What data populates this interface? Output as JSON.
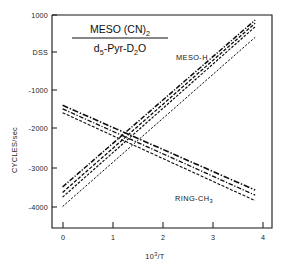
{
  "figure": {
    "background_color": "#ffffff",
    "line_color": "#0d0d0d",
    "axis_color": "#151515"
  },
  "title": {
    "numerator_main": "MESO (CN)",
    "numerator_sub": "2",
    "denominator_p1": "d",
    "denominator_p1_sub": "5",
    "denominator_p2": "-Pyr-D",
    "denominator_p2_sub": "2",
    "denominator_p3": "O"
  },
  "axes": {
    "ylabel": "CYCLES/sec",
    "xlabel_main": "10",
    "xlabel_sup": "3",
    "xlabel_tail": "/T",
    "yticks": [
      "1000",
      "DSS",
      "-1000",
      "-2000",
      "-3000",
      "-4000"
    ],
    "ytick_values": [
      1000,
      0,
      -1000,
      -2000,
      -3000,
      -4000
    ],
    "xticks": [
      "0",
      "1",
      "2",
      "3",
      "4"
    ],
    "xtick_values": [
      0,
      1,
      2,
      3,
      4
    ]
  },
  "annotations": {
    "meso_h": "MESO-H",
    "ring_ch3_main": "RING-CH",
    "ring_ch3_sub": "3"
  },
  "chart_data": {
    "type": "line",
    "xlabel": "10^3/T",
    "ylabel": "CYCLES/sec",
    "xlim": [
      -0.22,
      4.35
    ],
    "ylim": [
      -4450,
      1000
    ],
    "grid": false,
    "legend": "inline-annotations",
    "xticks": [
      0,
      1,
      2,
      3,
      4
    ],
    "yticks": [
      1000,
      0,
      -1000,
      -2000,
      -3000,
      -4000
    ],
    "ytick_labels": [
      "1000",
      "DSS",
      "-1000",
      "-2000",
      "-3000",
      "-4000"
    ],
    "series": [
      {
        "name": "MESO-H 1",
        "group": "MESO-H",
        "style": "dash-dot",
        "x": [
          0,
          4
        ],
        "y": [
          -3400,
          870
        ]
      },
      {
        "name": "MESO-H 2",
        "group": "MESO-H",
        "style": "dashed",
        "x": [
          0,
          4
        ],
        "y": [
          -3540,
          790
        ]
      },
      {
        "name": "MESO-H 3",
        "group": "MESO-H",
        "style": "dashed",
        "x": [
          0,
          4
        ],
        "y": [
          -3660,
          700
        ]
      },
      {
        "name": "MESO-H 4",
        "group": "MESO-H",
        "style": "dashed",
        "x": [
          0,
          4
        ],
        "y": [
          -3900,
          430
        ]
      },
      {
        "name": "RING-CH3 1",
        "group": "RING-CH3",
        "style": "dash-dot",
        "x": [
          0,
          4
        ],
        "y": [
          -1310,
          -3480
        ]
      },
      {
        "name": "RING-CH3 2",
        "group": "RING-CH3",
        "style": "dash-dot",
        "x": [
          0,
          4
        ],
        "y": [
          -1400,
          -3610
        ]
      },
      {
        "name": "RING-CH3 3",
        "group": "RING-CH3",
        "style": "dashed",
        "x": [
          0,
          4
        ],
        "y": [
          -1500,
          -3750
        ]
      }
    ],
    "crossover_point": {
      "x": 1.45,
      "y": -2250
    }
  }
}
